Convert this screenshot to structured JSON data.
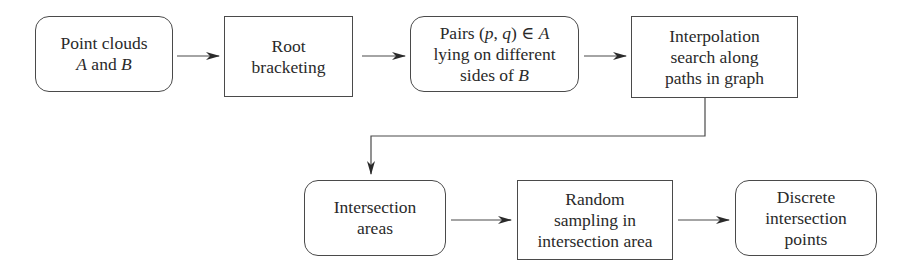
{
  "diagram": {
    "type": "flowchart",
    "nodes": [
      {
        "id": "n1",
        "shape": "rounded",
        "lines": [
          "Point clouds",
          "A and B"
        ],
        "italic_terms": [
          "A",
          "B"
        ]
      },
      {
        "id": "n2",
        "shape": "rect",
        "lines": [
          "Root",
          "bracketing"
        ]
      },
      {
        "id": "n3",
        "shape": "rounded",
        "lines": [
          "Pairs (p, q) ∈ A",
          "lying on different",
          "sides of B"
        ],
        "italic_terms": [
          "p",
          "q",
          "A",
          "B"
        ]
      },
      {
        "id": "n4",
        "shape": "rect",
        "lines": [
          "Interpolation",
          "search along",
          "paths in graph"
        ]
      },
      {
        "id": "n5",
        "shape": "rounded",
        "lines": [
          "Intersection",
          "areas"
        ]
      },
      {
        "id": "n6",
        "shape": "rect",
        "lines": [
          "Random",
          "sampling in",
          "intersection area"
        ]
      },
      {
        "id": "n7",
        "shape": "rounded",
        "lines": [
          "Discrete",
          "intersection",
          "points"
        ]
      }
    ],
    "edges": [
      {
        "from": "n1",
        "to": "n2"
      },
      {
        "from": "n2",
        "to": "n3"
      },
      {
        "from": "n3",
        "to": "n4"
      },
      {
        "from": "n4",
        "to": "n5",
        "routing": "elbow"
      },
      {
        "from": "n5",
        "to": "n6"
      },
      {
        "from": "n6",
        "to": "n7"
      }
    ],
    "colors": {
      "stroke": "#4a4a4a",
      "text": "#2a2a2a",
      "background": "#ffffff"
    }
  },
  "labels": {
    "n1": {
      "l1": "Point clouds",
      "l2a": "A",
      "l2b": " and ",
      "l2c": "B"
    },
    "n2": {
      "l1": "Root",
      "l2": "bracketing"
    },
    "n3": {
      "l1a": "Pairs (",
      "l1b": "p",
      "l1c": ", ",
      "l1d": "q",
      "l1e": ") ∈ ",
      "l1f": "A",
      "l2": "lying on different",
      "l3a": "sides of ",
      "l3b": "B"
    },
    "n4": {
      "l1": "Interpolation",
      "l2": "search along",
      "l3": "paths in graph"
    },
    "n5": {
      "l1": "Intersection",
      "l2": "areas"
    },
    "n6": {
      "l1": "Random",
      "l2": "sampling in",
      "l3": "intersection area"
    },
    "n7": {
      "l1": "Discrete",
      "l2": "intersection",
      "l3": "points"
    }
  }
}
